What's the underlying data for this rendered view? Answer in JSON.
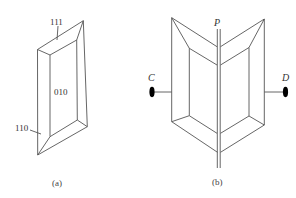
{
  "figure_a": {
    "caption": "(a)",
    "face_labels": {
      "top": "111",
      "front": "010",
      "side": "110"
    }
  },
  "figure_b": {
    "caption": "(b)",
    "plane_label": "P",
    "left_point_label": "C",
    "right_point_label": "D"
  },
  "colors": {
    "line": "#555555",
    "text": "#333333",
    "dot": "#000000"
  }
}
